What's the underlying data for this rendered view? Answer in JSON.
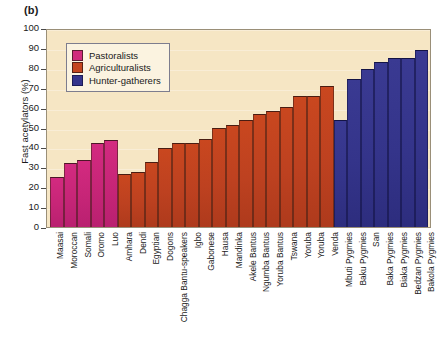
{
  "panel": {
    "label": "(b)"
  },
  "legend": {
    "items": [
      {
        "label": "Pastoralists",
        "color": "#d02a7c",
        "key": "pastoralists"
      },
      {
        "label": "Agriculturalists",
        "color": "#c4451f",
        "key": "agriculturalists"
      },
      {
        "label": "Hunter-gatherers",
        "color": "#35358c",
        "key": "hunter"
      }
    ]
  },
  "axes": {
    "ylabel": "Fast acetylators (%)",
    "yticks": [
      "0",
      "10",
      "20",
      "30",
      "40",
      "50",
      "60",
      "70",
      "80",
      "90",
      "100"
    ]
  },
  "style": {
    "plot_background": "#f6e6c4",
    "page_background": "#ffffff",
    "frame_color": "#9a8f78"
  },
  "chart_data": {
    "type": "bar",
    "title": "(b)",
    "xlabel": "",
    "ylabel": "Fast acetylators (%)",
    "ylim": [
      0,
      100
    ],
    "ytick_step": 10,
    "grid": true,
    "legend_position": "top-left",
    "categories": [
      "Maasai",
      "Moroccan",
      "Somali",
      "Oromo",
      "Luo",
      "Amhara",
      "Dendi",
      "Egyptian",
      "Dogons",
      "Chagga Bantu-speakers",
      "Igbo",
      "Gabonese",
      "Hausa",
      "Mandinka",
      "Akele Bantus",
      "Ngumba Bantus",
      "Yoruba Bantus",
      "Tswana",
      "Yoruba",
      "Yoruba",
      "Venda",
      "Mbuti Pygmies",
      "Baku Pygmies",
      "San",
      "Baka Pygmies",
      "Biaka Pygmies",
      "Bedzan Pygmies",
      "Bakola Pygmies"
    ],
    "values": [
      25,
      32,
      33.5,
      42,
      43.5,
      26.5,
      27.5,
      32.5,
      39.5,
      42,
      42,
      44,
      50,
      51.5,
      54,
      57,
      58.5,
      60.5,
      66,
      66,
      71,
      54,
      74.5,
      79.5,
      83,
      85,
      85,
      89
    ],
    "groups": [
      "pastoralists",
      "pastoralists",
      "pastoralists",
      "pastoralists",
      "pastoralists",
      "agriculturalists",
      "agriculturalists",
      "agriculturalists",
      "agriculturalists",
      "agriculturalists",
      "agriculturalists",
      "agriculturalists",
      "agriculturalists",
      "agriculturalists",
      "agriculturalists",
      "agriculturalists",
      "agriculturalists",
      "agriculturalists",
      "agriculturalists",
      "agriculturalists",
      "agriculturalists",
      "hunter",
      "hunter",
      "hunter",
      "hunter",
      "hunter",
      "hunter",
      "hunter"
    ],
    "series": [
      {
        "name": "Pastoralists",
        "color": "#d02a7c"
      },
      {
        "name": "Agriculturalists",
        "color": "#c4451f"
      },
      {
        "name": "Hunter-gatherers",
        "color": "#35358c"
      }
    ]
  }
}
